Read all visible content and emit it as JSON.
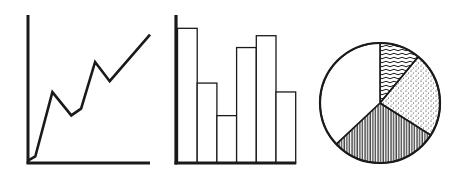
{
  "colors": {
    "ink": "#1a1a1a",
    "background": "#ffffff"
  },
  "chart_data": [
    {
      "type": "line",
      "title": "",
      "xlabel": "",
      "ylabel": "",
      "grid": false,
      "x": [
        0,
        1,
        2,
        3,
        4,
        5,
        6,
        7
      ],
      "values": [
        1,
        4,
        51,
        34,
        39,
        73,
        59,
        93
      ],
      "ylim": [
        0,
        100
      ],
      "note": "Unlabeled icon-style line chart; values are relative heights (0-100) estimated from pixel positions"
    },
    {
      "type": "bar",
      "title": "",
      "xlabel": "",
      "ylabel": "",
      "grid": false,
      "categories": [
        "1",
        "2",
        "3",
        "4",
        "5",
        "6"
      ],
      "values": [
        91,
        54,
        32,
        78,
        86,
        48
      ],
      "ylim": [
        0,
        100
      ],
      "note": "Unlabeled icon-style bar chart; values are relative heights (0-100) estimated from pixel positions"
    },
    {
      "type": "pie",
      "title": "",
      "legend": false,
      "slices": [
        {
          "label": "wavy-hatch",
          "value": 11,
          "fill": "wavy horizontal lines"
        },
        {
          "label": "stippled",
          "value": 23,
          "fill": "dots"
        },
        {
          "label": "vertical-hatch",
          "value": 29,
          "fill": "vertical lines"
        },
        {
          "label": "blank",
          "value": 37,
          "fill": "white"
        }
      ],
      "note": "Unlabeled icon-style pie chart; percentages estimated from slice angles"
    }
  ]
}
